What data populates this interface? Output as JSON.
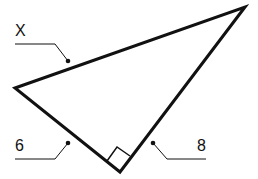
{
  "diagram": {
    "type": "right-triangle",
    "labels": {
      "hypotenuse": "X",
      "leg_left": "6",
      "leg_right": "8"
    },
    "right_angle_marker": true,
    "colors": {
      "stroke": "#111111",
      "background": "#ffffff"
    }
  }
}
